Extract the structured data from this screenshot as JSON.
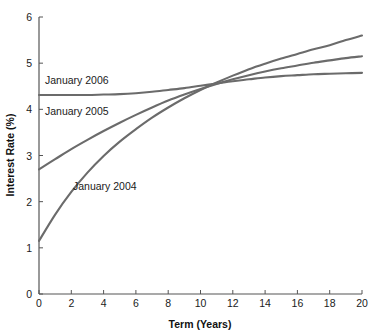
{
  "chart_data": {
    "type": "line",
    "title": "",
    "xlabel": "Term (Years)",
    "ylabel": "Interest Rate (%)",
    "xlim": [
      0,
      20
    ],
    "ylim": [
      0,
      6
    ],
    "grid": false,
    "legend_position": "inline-annotations",
    "line_color": "#6b6b6b",
    "axis_color": "#555555",
    "background": "#ffffff",
    "xticks": [
      0,
      2,
      4,
      6,
      8,
      10,
      12,
      14,
      16,
      18,
      20
    ],
    "xtick_labels": [
      "0",
      "2",
      "4",
      "6",
      "8",
      "10",
      "12",
      "14",
      "16",
      "18",
      "20"
    ],
    "yticks": [
      0,
      1,
      2,
      3,
      4,
      5,
      6
    ],
    "ytick_labels": [
      "0",
      "1",
      "2",
      "3",
      "4",
      "5",
      "6"
    ],
    "x": [
      0,
      1,
      2,
      3,
      4,
      5,
      6,
      7,
      8,
      9,
      10,
      11,
      12,
      13,
      14,
      15,
      16,
      17,
      18,
      19,
      20
    ],
    "series": [
      {
        "name": "January 2004",
        "label": "January 2004",
        "values": [
          1.15,
          1.72,
          2.21,
          2.63,
          2.99,
          3.3,
          3.57,
          3.82,
          4.04,
          4.24,
          4.42,
          4.58,
          4.73,
          4.87,
          4.99,
          5.1,
          5.2,
          5.3,
          5.39,
          5.5,
          5.6
        ]
      },
      {
        "name": "January 2005",
        "label": "January 2005",
        "values": [
          2.7,
          2.92,
          3.14,
          3.34,
          3.53,
          3.71,
          3.88,
          4.04,
          4.19,
          4.32,
          4.44,
          4.55,
          4.65,
          4.74,
          4.82,
          4.89,
          4.95,
          5.01,
          5.06,
          5.11,
          5.15
        ]
      },
      {
        "name": "January 2006",
        "label": "January 2006",
        "values": [
          4.31,
          4.31,
          4.31,
          4.31,
          4.32,
          4.33,
          4.35,
          4.38,
          4.42,
          4.46,
          4.51,
          4.56,
          4.61,
          4.65,
          4.69,
          4.72,
          4.74,
          4.76,
          4.77,
          4.78,
          4.79
        ]
      }
    ],
    "annotations": [
      {
        "text": "January 2006",
        "x_px": 45,
        "y_px": 84
      },
      {
        "text": "January 2005",
        "x_px": 45,
        "y_px": 115
      },
      {
        "text": "January 2004",
        "x_px": 73,
        "y_px": 190
      }
    ]
  }
}
